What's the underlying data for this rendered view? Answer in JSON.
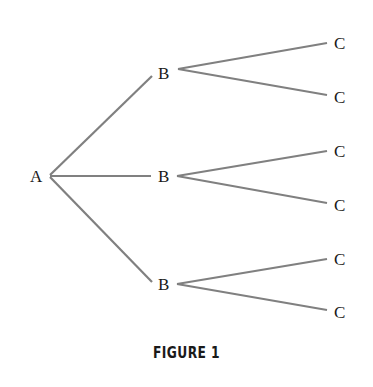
{
  "diagram": {
    "type": "tree",
    "nodes": [
      {
        "id": "a",
        "label": "A",
        "x": 37,
        "y": 182
      },
      {
        "id": "b1",
        "label": "B",
        "x": 164,
        "y": 79
      },
      {
        "id": "b2",
        "label": "B",
        "x": 164,
        "y": 182
      },
      {
        "id": "b3",
        "label": "B",
        "x": 164,
        "y": 289
      },
      {
        "id": "c1",
        "label": "C",
        "x": 340,
        "y": 49
      },
      {
        "id": "c2",
        "label": "C",
        "x": 340,
        "y": 103
      },
      {
        "id": "c3",
        "label": "C",
        "x": 340,
        "y": 156
      },
      {
        "id": "c4",
        "label": "C",
        "x": 340,
        "y": 210
      },
      {
        "id": "c5",
        "label": "C",
        "x": 340,
        "y": 264
      },
      {
        "id": "c6",
        "label": "C",
        "x": 340,
        "y": 317
      }
    ],
    "edges": [
      [
        "a",
        "b1"
      ],
      [
        "a",
        "b2"
      ],
      [
        "a",
        "b3"
      ],
      [
        "b1",
        "c1"
      ],
      [
        "b1",
        "c2"
      ],
      [
        "b2",
        "c3"
      ],
      [
        "b2",
        "c4"
      ],
      [
        "b3",
        "c5"
      ],
      [
        "b3",
        "c6"
      ]
    ],
    "edge_color": "#808080"
  },
  "caption": "FIGURE 1"
}
